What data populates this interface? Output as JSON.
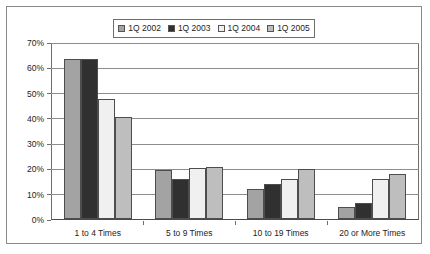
{
  "chart_data": {
    "type": "bar",
    "title": "",
    "subtitle": "",
    "xlabel": "",
    "ylabel": "",
    "categories": [
      "1 to 4 Times",
      "5 to 9 Times",
      "10 to 19 Times",
      "20 or More Times"
    ],
    "series": [
      {
        "name": "1Q 2002",
        "color": "#a3a3a3",
        "values": [
          64,
          19.5,
          12,
          5
        ]
      },
      {
        "name": "1Q 2003",
        "color": "#303030",
        "values": [
          64,
          16,
          14,
          6.5
        ]
      },
      {
        "name": "1Q 2004",
        "color": "#f0f0f0",
        "values": [
          48,
          20.5,
          16,
          16
        ]
      },
      {
        "name": "1Q 2005",
        "color": "#bebebe",
        "values": [
          41,
          21,
          20,
          18
        ]
      }
    ],
    "ylim": [
      0,
      70
    ],
    "ytick_step": 10,
    "ytick_labels": [
      "0%",
      "10%",
      "20%",
      "30%",
      "40%",
      "50%",
      "60%",
      "70%"
    ],
    "grid": true,
    "grid_axis": "y",
    "legend_position": "top-center",
    "bar_border_color": "#4d4d4d",
    "plot_border_color": "#6d6d6d",
    "frame_border_color": "#8a8a8a",
    "background_color": "#ffffff",
    "text_color": "#1d1d1d"
  },
  "legend": {
    "entries": [
      {
        "label": "1Q 2002"
      },
      {
        "label": "1Q 2003"
      },
      {
        "label": "1Q 2004"
      },
      {
        "label": "1Q 2005"
      }
    ]
  }
}
